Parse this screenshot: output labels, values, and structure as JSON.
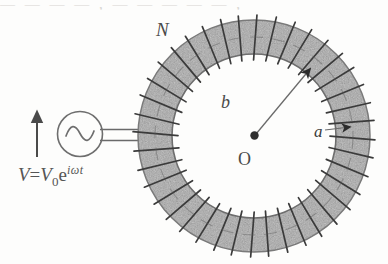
{
  "figure": {
    "top_cropped_text": "— — — — ,  — — — — — ,",
    "colors": {
      "core_fill": "#a9a9a9",
      "winding_line": "#3a3a3a",
      "outline": "#6e6e6e",
      "label_text": "#4a4a4a",
      "arrowhead": "#2b2b2b",
      "background": "#fdfdfc"
    }
  },
  "labels": {
    "turns": "N",
    "outer_radius": "b",
    "center": "O",
    "inner_radius": "a"
  },
  "formula": {
    "lhs": "V",
    "equals": "=",
    "amplitude": "V",
    "amplitude_subscript": "0",
    "base": "e",
    "exponent": "iωt",
    "full": "V=V₀e^(iωt)"
  },
  "source": {
    "name": "ac-voltage-source",
    "symbol": "sine-wave",
    "polarity_arrow": "up"
  },
  "geometry": {
    "center_x": 254,
    "center_y": 136,
    "outer_radius": 116,
    "inner_radius": 82,
    "winding_count": 40,
    "source_center_x": 80,
    "source_center_y": 134,
    "source_radius": 22,
    "arrow_x": 37,
    "arrow_top_y": 111,
    "arrow_bottom_y": 157,
    "lead_y_top": 129,
    "lead_y_bottom": 140,
    "lead_left_x": 102,
    "lead_right_x": 150,
    "radius_line_end_x": 312,
    "radius_line_end_y": 66,
    "inner_arrow_x": 348,
    "inner_arrow_y": 127
  }
}
